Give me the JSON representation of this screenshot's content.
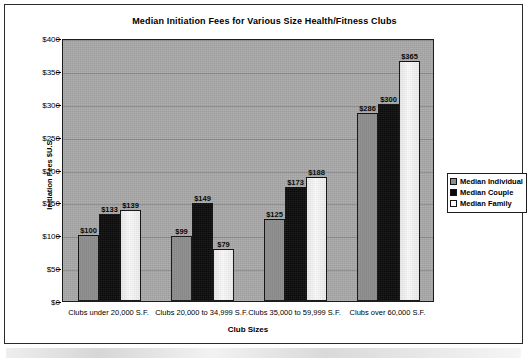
{
  "chart_data": {
    "type": "bar",
    "title": "Median Initiation Fees for Various Size Health/Fitness Clubs",
    "xlabel": "Club Sizes",
    "ylabel": "Initiation Fees $U.S.",
    "ylim": [
      0,
      400
    ],
    "ytick_step": 50,
    "ytick_labels": [
      "$0",
      "$50",
      "$100",
      "$150",
      "$200",
      "$250",
      "$300",
      "$350",
      "$400"
    ],
    "grid": true,
    "legend_position": "right",
    "categories": [
      "Clubs under 20,000 S.F.",
      "Clubs 20,000 to 34,999 S.F.",
      "Clubs 35,000 to 59,999 S.F.",
      "Clubs over 60,000 S.F."
    ],
    "series": [
      {
        "name": "Median Individual",
        "color": "#8d8d8d",
        "values": [
          100,
          99,
          125,
          286
        ],
        "labels": [
          "$100",
          "$99",
          "$125",
          "$286"
        ]
      },
      {
        "name": "Median Couple",
        "color": "#0b0b0b",
        "values": [
          133,
          149,
          173,
          300
        ],
        "labels": [
          "$133",
          "$149",
          "$173",
          "$300"
        ]
      },
      {
        "name": "Median Family",
        "color": "#f4f4f4",
        "values": [
          139,
          79,
          188,
          365
        ],
        "labels": [
          "$139",
          "$79",
          "$188",
          "$365"
        ]
      }
    ]
  }
}
